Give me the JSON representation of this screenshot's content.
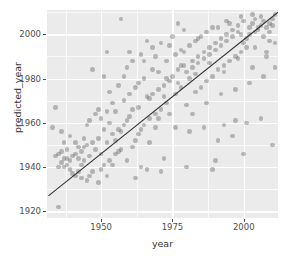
{
  "chart_data": {
    "type": "scatter",
    "title": "",
    "xlabel": "year",
    "ylabel": "predicted_year",
    "xlim": [
      1931,
      2012
    ],
    "ylim": [
      1917,
      2011
    ],
    "xticks": [
      1950,
      1975,
      2000
    ],
    "yticks": [
      1920,
      1940,
      1960,
      1980,
      2000
    ],
    "xtick_labels": [
      "1950",
      "1975",
      "2000"
    ],
    "ytick_labels": [
      "1920",
      "1940",
      "1960",
      "1980",
      "2000"
    ],
    "grid": true,
    "legend": "none",
    "panel_background": "#ebebeb",
    "gridline_color": "#ffffff",
    "point_color": "#3c3c3c",
    "point_opacity": 0.32,
    "reference_line": {
      "name": "identity-line",
      "description": "y = x diagonal reference line",
      "color": "#333333",
      "x_start": 1931.5,
      "y_start": 1927.0,
      "x_end": 2012.0,
      "y_end": 2010.0
    },
    "points": [
      [
        1935,
        1922
      ],
      [
        1934,
        1967
      ],
      [
        1933,
        1958
      ],
      [
        1935,
        1946
      ],
      [
        1936,
        1947
      ],
      [
        1937,
        1944
      ],
      [
        1936,
        1942
      ],
      [
        1938,
        1944
      ],
      [
        1937,
        1940
      ],
      [
        1938,
        1941
      ],
      [
        1939,
        1943
      ],
      [
        1939,
        1939
      ],
      [
        1940,
        1945
      ],
      [
        1941,
        1946
      ],
      [
        1940,
        1937
      ],
      [
        1942,
        1944
      ],
      [
        1941,
        1936
      ],
      [
        1943,
        1947
      ],
      [
        1942,
        1938
      ],
      [
        1944,
        1949
      ],
      [
        1943,
        1941
      ],
      [
        1945,
        1950
      ],
      [
        1944,
        1943
      ],
      [
        1946,
        1945
      ],
      [
        1945,
        1934
      ],
      [
        1947,
        1951
      ],
      [
        1946,
        1936
      ],
      [
        1948,
        1948
      ],
      [
        1947,
        1938
      ],
      [
        1949,
        1966
      ],
      [
        1950,
        1939
      ],
      [
        1951,
        1941
      ],
      [
        1949,
        1953
      ],
      [
        1952,
        1951
      ],
      [
        1950,
        1962
      ],
      [
        1953,
        1943
      ],
      [
        1951,
        1981
      ],
      [
        1954,
        1955
      ],
      [
        1952,
        1965
      ],
      [
        1955,
        1946
      ],
      [
        1953,
        1974
      ],
      [
        1956,
        1957
      ],
      [
        1954,
        1969
      ],
      [
        1957,
        1948
      ],
      [
        1955,
        1952
      ],
      [
        1958,
        1959
      ],
      [
        1956,
        1977
      ],
      [
        1959,
        1961
      ],
      [
        1957,
        1956
      ],
      [
        1960,
        1963
      ],
      [
        1958,
        1970
      ],
      [
        1961,
        1966
      ],
      [
        1959,
        1985
      ],
      [
        1962,
        1952
      ],
      [
        1960,
        1973
      ],
      [
        1963,
        1955
      ],
      [
        1961,
        1988
      ],
      [
        1964,
        1957
      ],
      [
        1962,
        1976
      ],
      [
        1965,
        1959
      ],
      [
        1963,
        1967
      ],
      [
        1966,
        1972
      ],
      [
        1964,
        1991
      ],
      [
        1967,
        1962
      ],
      [
        1965,
        1980
      ],
      [
        1968,
        1973
      ],
      [
        1966,
        1939
      ],
      [
        1969,
        1964
      ],
      [
        1967,
        1971
      ],
      [
        1970,
        1975
      ],
      [
        1968,
        1994
      ],
      [
        1971,
        1966
      ],
      [
        1969,
        1958
      ],
      [
        1972,
        1977
      ],
      [
        1970,
        1983
      ],
      [
        1973,
        1969
      ],
      [
        1971,
        1996
      ],
      [
        1974,
        1979
      ],
      [
        1972,
        1972
      ],
      [
        1975,
        1981
      ],
      [
        1973,
        1988
      ],
      [
        1976,
        1973
      ],
      [
        1974,
        1964
      ],
      [
        1977,
        1984
      ],
      [
        1975,
        1999
      ],
      [
        1978,
        1976
      ],
      [
        1976,
        1991
      ],
      [
        1979,
        1986
      ],
      [
        1977,
        1978
      ],
      [
        1980,
        1968
      ],
      [
        1978,
        1993
      ],
      [
        1981,
        1980
      ],
      [
        1979,
        2002
      ],
      [
        1982,
        1988
      ],
      [
        1980,
        1983
      ],
      [
        1983,
        1974
      ],
      [
        1981,
        1995
      ],
      [
        1984,
        1990
      ],
      [
        1982,
        1985
      ],
      [
        1985,
        1976
      ],
      [
        1983,
        1997
      ],
      [
        1986,
        1992
      ],
      [
        1984,
        1987
      ],
      [
        1987,
        1979
      ],
      [
        1985,
        1999
      ],
      [
        1988,
        1994
      ],
      [
        1986,
        1989
      ],
      [
        1989,
        1981
      ],
      [
        1987,
        2001
      ],
      [
        1990,
        1996
      ],
      [
        1988,
        1991
      ],
      [
        1991,
        1984
      ],
      [
        1989,
        1939
      ],
      [
        1992,
        1998
      ],
      [
        1990,
        1993
      ],
      [
        1993,
        1986
      ],
      [
        1991,
        2003
      ],
      [
        1994,
        2000
      ],
      [
        1992,
        1995
      ],
      [
        1995,
        1988
      ],
      [
        1993,
        1959
      ],
      [
        1996,
        2002
      ],
      [
        1994,
        1997
      ],
      [
        1997,
        1990
      ],
      [
        1995,
        2005
      ],
      [
        1998,
        2004
      ],
      [
        1996,
        1999
      ],
      [
        1999,
        1992
      ],
      [
        1997,
        1961
      ],
      [
        2000,
        2006
      ],
      [
        1998,
        2001
      ],
      [
        2001,
        1994
      ],
      [
        1999,
        2008
      ],
      [
        2002,
        2003
      ],
      [
        2000,
        1996
      ],
      [
        2003,
        2005
      ],
      [
        2001,
        1998
      ],
      [
        2004,
        2007
      ],
      [
        2002,
        2000
      ],
      [
        2005,
        2002
      ],
      [
        2003,
        2009
      ],
      [
        2006,
        2004
      ],
      [
        2004,
        2001
      ],
      [
        2007,
        2006
      ],
      [
        2005,
        2003
      ],
      [
        2008,
        1992
      ],
      [
        2006,
        2008
      ],
      [
        2009,
        2005
      ],
      [
        2007,
        1999
      ],
      [
        2010,
        2007
      ],
      [
        2008,
        2003
      ],
      [
        2011,
        2009
      ],
      [
        2009,
        2001
      ],
      [
        2010,
        2004
      ],
      [
        2011,
        1996
      ],
      [
        1957,
        2007
      ],
      [
        1966,
        1997
      ],
      [
        1977,
        2005
      ],
      [
        1947,
        1984
      ],
      [
        1952,
        1992
      ],
      [
        1944,
        1953
      ],
      [
        1939,
        1954
      ],
      [
        1936,
        1956
      ],
      [
        1934,
        1945
      ],
      [
        1942,
        1949
      ],
      [
        1948,
        1964
      ],
      [
        1953,
        1960
      ],
      [
        1958,
        1981
      ],
      [
        1963,
        1978
      ],
      [
        1968,
        1984
      ],
      [
        1973,
        1980
      ],
      [
        1978,
        1986
      ],
      [
        1983,
        1982
      ],
      [
        1988,
        1987
      ],
      [
        1993,
        1983
      ],
      [
        1998,
        1989
      ],
      [
        2003,
        1985
      ],
      [
        2008,
        1990
      ],
      [
        1946,
        1961
      ],
      [
        1951,
        1957
      ],
      [
        1956,
        1947
      ],
      [
        1961,
        1949
      ],
      [
        1967,
        1951
      ],
      [
        1972,
        1944
      ],
      [
        1981,
        1956
      ],
      [
        1986,
        1958
      ],
      [
        1991,
        1952
      ],
      [
        1996,
        1954
      ],
      [
        2001,
        1960
      ],
      [
        2006,
        1962
      ],
      [
        1935,
        1940
      ],
      [
        1938,
        1948
      ],
      [
        1941,
        1951
      ],
      [
        1950,
        1946
      ],
      [
        1954,
        1941
      ],
      [
        1959,
        1943
      ],
      [
        1964,
        1940
      ],
      [
        1969,
        1990
      ],
      [
        1974,
        1995
      ],
      [
        1979,
        1992
      ],
      [
        1984,
        1998
      ],
      [
        1989,
        2003
      ],
      [
        1994,
        2006
      ],
      [
        1999,
        2000
      ],
      [
        2004,
        1994
      ],
      [
        2009,
        1997
      ],
      [
        1937,
        1951
      ],
      [
        1943,
        1935
      ],
      [
        1949,
        1933
      ],
      [
        1955,
        1965
      ],
      [
        1960,
        1992
      ],
      [
        1965,
        1988
      ],
      [
        1970,
        1962
      ],
      [
        1976,
        1958
      ],
      [
        1982,
        1964
      ],
      [
        1987,
        1969
      ],
      [
        1992,
        1973
      ],
      [
        1997,
        1975
      ],
      [
        2002,
        1978
      ],
      [
        2007,
        1981
      ],
      [
        2011,
        1985
      ],
      [
        1945,
        1959
      ],
      [
        1952,
        1936
      ],
      [
        1962,
        1935
      ],
      [
        1971,
        1938
      ],
      [
        1980,
        1940
      ],
      [
        1990,
        1943
      ],
      [
        2000,
        1946
      ],
      [
        2010,
        1950
      ]
    ]
  },
  "axes": {
    "x_label": "year",
    "y_label": "predicted_year"
  }
}
